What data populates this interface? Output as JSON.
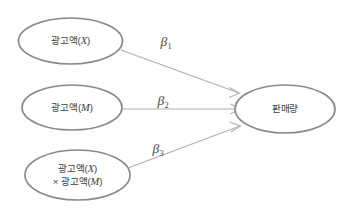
{
  "diagram": {
    "type": "path-model",
    "background_color": "#fefefe",
    "node_stroke_color": "#8a8a8a",
    "edge_color": "#b0b0b0",
    "text_color": "#3d3d3d",
    "nodes": [
      {
        "id": "predictor-x",
        "label_main": "광고액(",
        "label_var": "X",
        "label_close": ")",
        "cx": 70.5,
        "cy": 41,
        "rx": 52,
        "ry": 23
      },
      {
        "id": "predictor-m",
        "label_main": "광고액(",
        "label_var": "M",
        "label_close": ")",
        "cx": 72,
        "cy": 107.5,
        "rx": 50,
        "ry": 22.5
      },
      {
        "id": "predictor-interaction",
        "label_main": "광고액(",
        "label_var": "X",
        "label_close": ")",
        "label_line2_prefix": "× 광고액(",
        "label_line2_var": "M",
        "label_line2_close": ")",
        "cx": 77.5,
        "cy": 175,
        "rx": 52.5,
        "ry": 25
      },
      {
        "id": "outcome-sales",
        "label_main": "판매량",
        "cx": 285,
        "cy": 109,
        "rx": 50,
        "ry": 24
      }
    ],
    "edges": [
      {
        "id": "edge-beta1",
        "from": "predictor-x",
        "to": "outcome-sales",
        "coefficient": "β",
        "subscript": "1",
        "label_x": 166,
        "label_y": 42
      },
      {
        "id": "edge-beta2",
        "from": "predictor-m",
        "to": "outcome-sales",
        "coefficient": "β",
        "subscript": "2",
        "label_x": 163,
        "label_y": 101
      },
      {
        "id": "edge-beta3",
        "from": "predictor-interaction",
        "to": "outcome-sales",
        "coefficient": "β",
        "subscript": "3",
        "label_x": 158,
        "label_y": 149
      }
    ]
  }
}
